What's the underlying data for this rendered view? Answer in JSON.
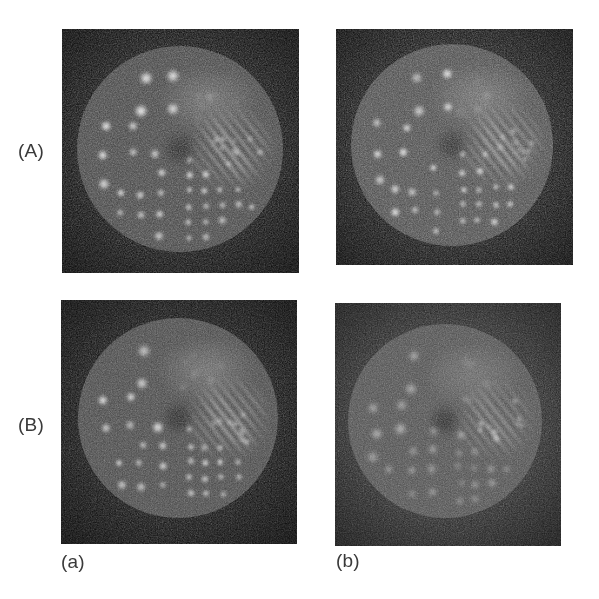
{
  "figure": {
    "kind": "multi-panel-grayscale-image-figure",
    "background_color": "#ffffff",
    "rows": 2,
    "columns": 2,
    "row_labels": [
      {
        "id": "row-A",
        "text": "(A)",
        "x": 18,
        "y": 141
      },
      {
        "id": "row-B",
        "text": "(B)",
        "x": 18,
        "y": 415
      }
    ],
    "column_labels": [
      {
        "id": "col-a",
        "text": "(a)",
        "x": 61,
        "y": 552
      },
      {
        "id": "col-b",
        "text": "(b)",
        "x": 336,
        "y": 551
      }
    ],
    "label_color": "#3a3a3a"
  },
  "panels": [
    {
      "id": "panel-Aa",
      "row_label": "(A)",
      "column_label": "(a)",
      "x": 62,
      "y": 29,
      "width": 237,
      "height": 244,
      "background_color": "#080808",
      "phantom": {
        "shape": "circle",
        "center_x": 118,
        "center_y": 120,
        "radius": 103,
        "fill_color": "#3d3d3d",
        "rim_color": "#6e6e6e",
        "contrast": "high",
        "noise_level": 0.62
      },
      "sectors": 6,
      "description": "Jaszczak hot-rod phantom, six pie sectors of decreasing rod diameter"
    },
    {
      "id": "panel-Ab",
      "row_label": "(A)",
      "column_label": "(b)",
      "x": 336,
      "y": 29,
      "width": 237,
      "height": 236,
      "background_color": "#0c0c0c",
      "phantom": {
        "shape": "circle",
        "center_x": 116,
        "center_y": 116,
        "radius": 101,
        "fill_color": "#434343",
        "rim_color": "#747474",
        "contrast": "high",
        "noise_level": 0.7
      },
      "sectors": 6,
      "description": "Same phantom, second reconstruction method, slightly noisier"
    },
    {
      "id": "panel-Ba",
      "row_label": "(B)",
      "column_label": "(a)",
      "x": 61,
      "y": 300,
      "width": 236,
      "height": 244,
      "background_color": "#0a0a0a",
      "phantom": {
        "shape": "circle",
        "center_x": 117,
        "center_y": 118,
        "radius": 100,
        "fill_color": "#414141",
        "rim_color": "#6f6f6f",
        "contrast": "high",
        "noise_level": 0.5
      },
      "sectors": 6,
      "description": "Same phantom, smoother reconstruction, well resolved hot rods"
    },
    {
      "id": "panel-Bb",
      "row_label": "(B)",
      "column_label": "(b)",
      "x": 335,
      "y": 303,
      "width": 226,
      "height": 243,
      "background_color": "#232323",
      "phantom": {
        "shape": "circle",
        "center_x": 110,
        "center_y": 118,
        "radius": 97,
        "fill_color": "#4a4a4a",
        "rim_color": "#707070",
        "contrast": "low",
        "noise_level": 0.45
      },
      "sectors": 6,
      "description": "Same phantom with elevated background, lower contrast"
    }
  ],
  "phantom_model": {
    "type": "hot-rod sector phantom",
    "sector_count": 6,
    "sector_span_degrees": 60,
    "sectors": [
      {
        "index": 0,
        "start_angle": 270,
        "label": "top",
        "rod_size": "smallest",
        "resolved": false,
        "render": "haze"
      },
      {
        "index": 1,
        "start_angle": 330,
        "label": "upper-right",
        "rod_size": "small",
        "resolved": false,
        "render": "stripes"
      },
      {
        "index": 2,
        "start_angle": 30,
        "label": "lower-right",
        "rod_size": "medium-small",
        "resolved": true,
        "render": "dots",
        "rod_radius": 4.0,
        "spacing": 16
      },
      {
        "index": 3,
        "start_angle": 90,
        "label": "bottom",
        "rod_size": "medium",
        "resolved": true,
        "render": "dots",
        "rod_radius": 4.6,
        "spacing": 21
      },
      {
        "index": 4,
        "start_angle": 150,
        "label": "lower-left",
        "rod_size": "large",
        "resolved": true,
        "render": "dots",
        "rod_radius": 5.6,
        "spacing": 27
      },
      {
        "index": 5,
        "start_angle": 210,
        "label": "upper-left",
        "rod_size": "largest",
        "resolved": true,
        "render": "dots",
        "rod_radius": 6.4,
        "spacing": 33
      }
    ],
    "hot_color": "#f2f2f2",
    "cold_color": "#2a2a2a"
  }
}
